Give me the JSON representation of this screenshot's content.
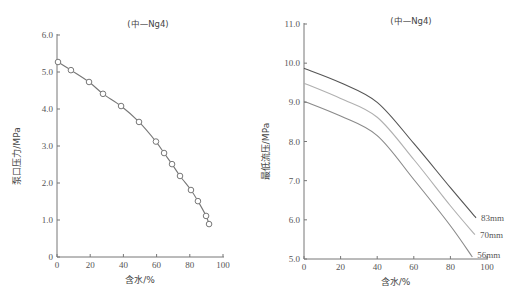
{
  "chart_data": [
    {
      "type": "scatter",
      "title": "(中—Ng4)",
      "xlabel": "含水/%",
      "ylabel": "泵口压力/MPa",
      "xlim": [
        0,
        100
      ],
      "ylim": [
        0,
        6.0
      ],
      "xticks": [
        0,
        20,
        40,
        60,
        80,
        100
      ],
      "xtick_labels": [
        "0",
        "20",
        "40",
        "60",
        "80",
        "100"
      ],
      "yticks": [
        0,
        1.0,
        2.0,
        3.0,
        4.0,
        5.0,
        6.0
      ],
      "ytick_labels": [
        "0",
        "1.0",
        "2.0",
        "3.0",
        "4.0",
        "5.0",
        "6.0"
      ],
      "grid": false,
      "legend": null,
      "series": [
        {
          "name": "泵口压力",
          "marker": "open-circle",
          "line": true,
          "color": "#777777",
          "x": [
            0.6,
            8.4,
            19.3,
            27.7,
            38.6,
            49.4,
            59.6,
            64.5,
            69.3,
            74.1,
            80.7,
            84.9,
            89.8,
            91.6
          ],
          "y": [
            5.27,
            5.05,
            4.73,
            4.41,
            4.08,
            3.65,
            3.12,
            2.81,
            2.51,
            2.19,
            1.81,
            1.51,
            1.11,
            0.89
          ]
        }
      ]
    },
    {
      "type": "line",
      "title": "(中—Ng4)",
      "xlabel": "含水/%",
      "ylabel": "最低流压/MPa",
      "xlim": [
        0,
        100
      ],
      "ylim": [
        5.0,
        11.0
      ],
      "xticks": [
        0,
        20,
        40,
        60,
        80,
        100
      ],
      "xtick_labels": [
        "0",
        "20",
        "40",
        "60",
        "80",
        "100"
      ],
      "yticks": [
        5.0,
        6.0,
        7.0,
        8.0,
        9.0,
        10.0,
        11.0
      ],
      "ytick_labels": [
        "5.0",
        "6.0",
        "7.0",
        "8.0",
        "9.0",
        "10.0",
        "11.0"
      ],
      "grid": false,
      "legend": "inline labels at line ends",
      "series": [
        {
          "name": "83mm",
          "color": "#555555",
          "x": [
            0,
            20,
            40,
            60,
            80,
            94
          ],
          "y": [
            9.87,
            9.5,
            9.0,
            7.95,
            6.82,
            6.05
          ]
        },
        {
          "name": "70mm",
          "color": "#b0b0b0",
          "x": [
            0,
            20,
            40,
            60,
            80,
            93.4
          ],
          "y": [
            9.49,
            9.1,
            8.62,
            7.54,
            6.36,
            5.62
          ]
        },
        {
          "name": "56mm",
          "color": "#8a8a8a",
          "x": [
            0,
            20,
            40,
            60,
            80,
            92
          ],
          "y": [
            9.03,
            8.65,
            8.15,
            7.03,
            5.85,
            5.05
          ]
        }
      ]
    }
  ]
}
